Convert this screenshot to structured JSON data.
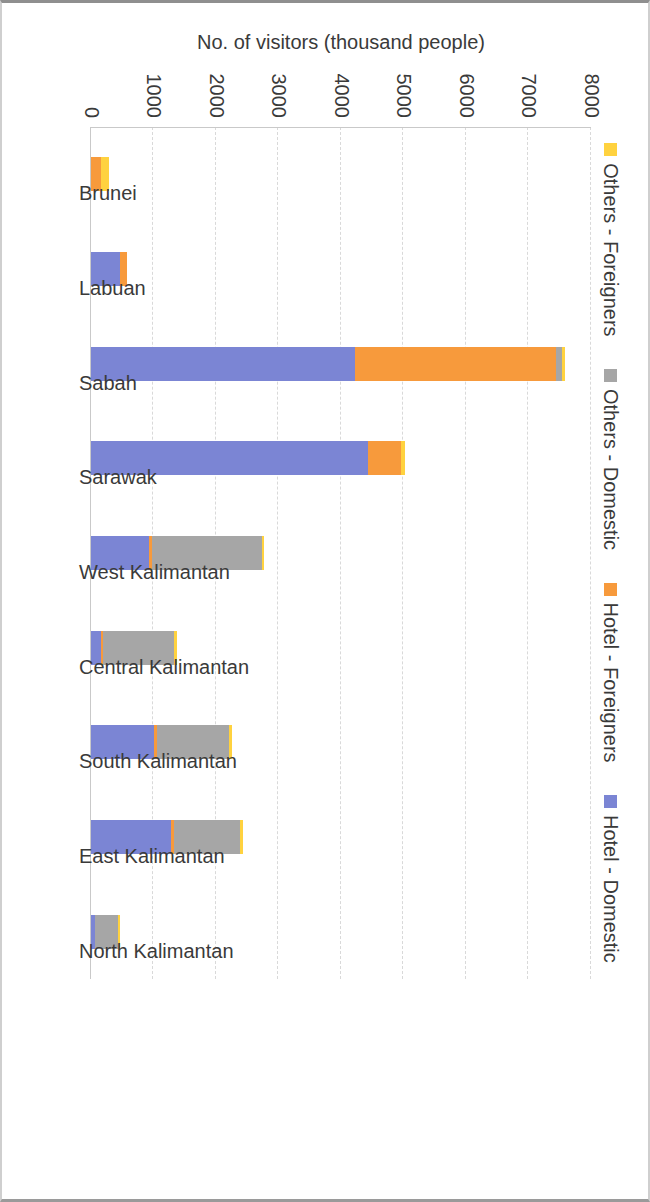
{
  "chart_data": {
    "type": "bar",
    "subtype": "stacked-bar",
    "title": "",
    "xlabel": "",
    "ylabel": "No. of visitors (thousand people)",
    "ylim": [
      0,
      8000
    ],
    "ytick_labels": [
      "0",
      "1000",
      "2000",
      "3000",
      "4000",
      "5000",
      "6000",
      "7000",
      "8000"
    ],
    "ytick_values": [
      0,
      1000,
      2000,
      3000,
      4000,
      5000,
      6000,
      7000,
      8000
    ],
    "grid": true,
    "grid_style": "dashed horizontal",
    "legend_position": "bottom",
    "orientation": "page rotated 90 degrees clockwise",
    "categories": [
      "Brunei",
      "Labuan",
      "Sabah",
      "Sarawak",
      "West Kalimantan",
      "Central Kalimantan",
      "South Kalimantan",
      "East Kalimantan",
      "North Kalimantan"
    ],
    "series": [
      {
        "name": "Hotel -  Domestic",
        "color": "#7b85d4",
        "values": [
          0,
          470,
          4230,
          4430,
          925,
          160,
          1015,
          1285,
          70
        ]
      },
      {
        "name": "Hotel -  Foreigners",
        "color": "#f79a3c",
        "values": [
          160,
          100,
          3215,
          530,
          45,
          35,
          45,
          45,
          0
        ]
      },
      {
        "name": "Others -  Domestic",
        "color": "#a6a6a6",
        "values": [
          0,
          0,
          90,
          0,
          1770,
          1140,
          1155,
          1060,
          355
        ]
      },
      {
        "name": "Others -  Foreigners",
        "color": "#ffd23f",
        "values": [
          130,
          0,
          45,
          60,
          35,
          35,
          35,
          35,
          35
        ]
      }
    ],
    "totals": [
      290,
      570,
      7580,
      5020,
      2775,
      1370,
      2250,
      2425,
      460
    ]
  },
  "legend": {
    "items": [
      {
        "label": "Hotel -  Domestic",
        "color": "#7b85d4"
      },
      {
        "label": "Hotel -  Foreigners",
        "color": "#f79a3c"
      },
      {
        "label": "Others -  Domestic",
        "color": "#a6a6a6"
      },
      {
        "label": "Others -  Foreigners",
        "color": "#ffd23f"
      }
    ]
  }
}
